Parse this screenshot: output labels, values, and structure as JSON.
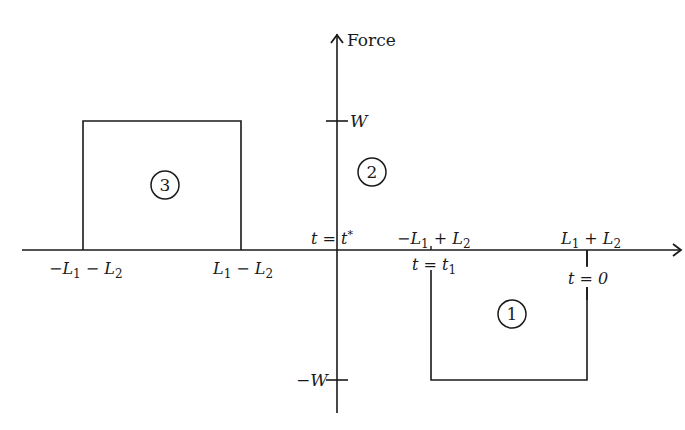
{
  "diagram": {
    "y_axis": {
      "label": "Force",
      "ticks": [
        {
          "name": "W",
          "text": "W",
          "value": "W"
        },
        {
          "name": "minus-W",
          "text": "−W",
          "value": "-W"
        }
      ]
    },
    "x_axis": {
      "labels_above": [
        {
          "name": "t-star",
          "main": "t = t",
          "sup": "*"
        },
        {
          "name": "neg-L1-plus-L2",
          "parts": [
            "−L",
            "1",
            " + L",
            "2"
          ]
        },
        {
          "name": "L1-plus-L2",
          "parts": [
            "L",
            "1",
            " + L",
            "2"
          ]
        }
      ],
      "labels_below": [
        {
          "name": "neg-L1-minus-L2",
          "parts": [
            "−L",
            "1",
            " − L",
            "2"
          ]
        },
        {
          "name": "L1-minus-L2",
          "parts": [
            "L",
            "1",
            " − L",
            "2"
          ]
        },
        {
          "name": "t-equals-t1",
          "parts": [
            "t = t",
            "1"
          ]
        },
        {
          "name": "t-equals-0",
          "text": "t = 0"
        }
      ]
    },
    "regions": [
      {
        "id": "1",
        "label": "1",
        "description": "Negative pulse of height −W from −L1+L2 to L1+L2"
      },
      {
        "id": "2",
        "label": "2",
        "description": "Region near the force axis"
      },
      {
        "id": "3",
        "label": "3",
        "description": "Positive pulse of height W from −L1−L2 to L1−L2"
      }
    ],
    "pulses": [
      {
        "region": "3",
        "from": "-L1-L2",
        "to": "L1-L2",
        "height": "W"
      },
      {
        "region": "1",
        "from": "-L1+L2",
        "to": "L1+L2",
        "height": "-W"
      }
    ]
  }
}
